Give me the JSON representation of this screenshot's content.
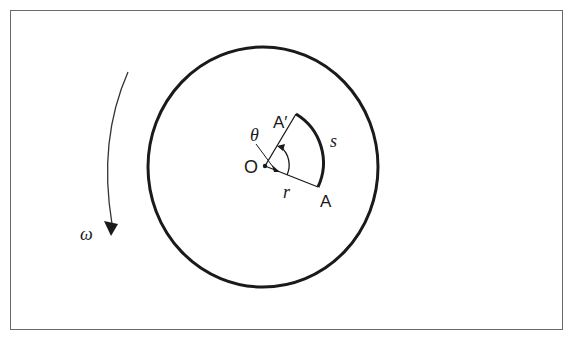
{
  "diagram": {
    "type": "angular-displacement",
    "labels": {
      "center": "O",
      "point_start": "A",
      "point_end": "A′",
      "arc_length": "s",
      "radius": "r",
      "angle": "θ",
      "angular_velocity": "ω"
    },
    "colors": {
      "stroke": "#1a1a1a",
      "frame": "#6a6a6a",
      "background": "#ffffff"
    }
  }
}
